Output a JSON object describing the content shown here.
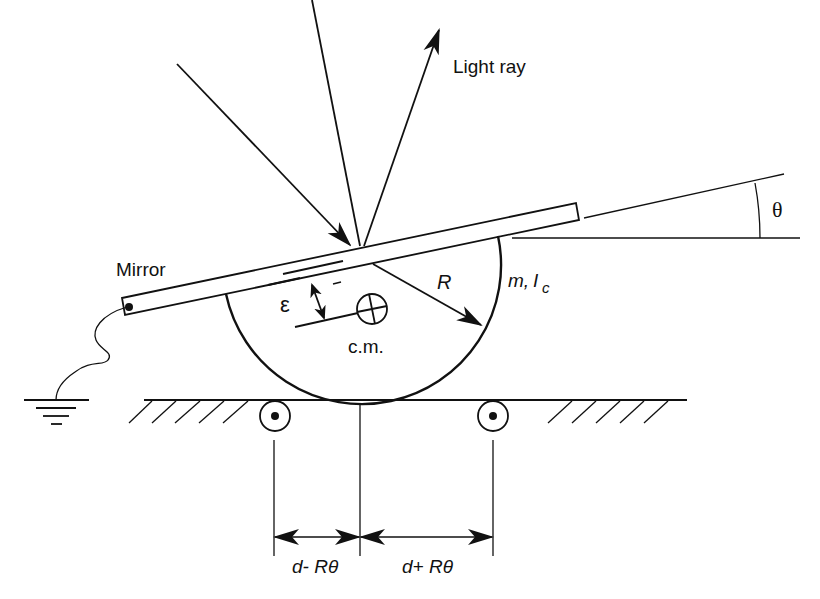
{
  "diagram": {
    "labels": {
      "light_ray": "Light ray",
      "mirror": "Mirror",
      "radius": "R",
      "mass_inertia_m": "m,",
      "mass_inertia_I": "I",
      "mass_inertia_sub": "c",
      "epsilon": "ε",
      "center_of_mass": "c.m.",
      "theta": "θ",
      "left_distance": "d- Rθ",
      "right_distance": "d+ Rθ"
    },
    "components": [
      "incident light ray",
      "reflected light ray",
      "mirror normal",
      "tilted mirror bar",
      "semicircular body",
      "center of mass marker",
      "epsilon offset dimension",
      "radius arrow",
      "ground wire with earth symbol",
      "ground surface with hatching",
      "left roller support",
      "right roller support",
      "tilt angle theta indicator",
      "distance dimension arrows"
    ],
    "colors": {
      "stroke": "#111111",
      "background": "#ffffff"
    }
  }
}
